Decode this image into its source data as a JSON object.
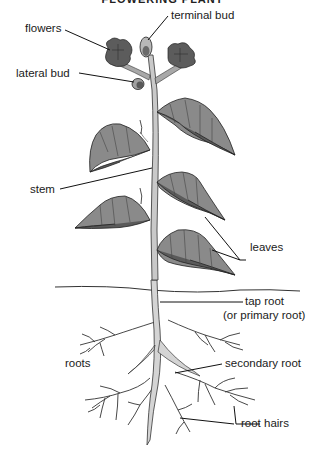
{
  "title": "FLOWERING PLANT",
  "colors": {
    "leaf_light": "#8a8a8a",
    "leaf_dark": "#5a5a5a",
    "flower": "#5c5c5c",
    "stem": "#c9c9c9",
    "root": "#d4d4d4",
    "outline": "#222222",
    "leader_line": "#111111"
  },
  "labels": {
    "flowers": "flowers",
    "terminal_bud": "terminal bud",
    "lateral_bud": "lateral bud",
    "stem": "stem",
    "leaves": "leaves",
    "tap_root": "tap root",
    "tap_root_alt": "(or primary root)",
    "roots": "roots",
    "secondary_root": "secondary root",
    "root_hairs": "root hairs"
  }
}
